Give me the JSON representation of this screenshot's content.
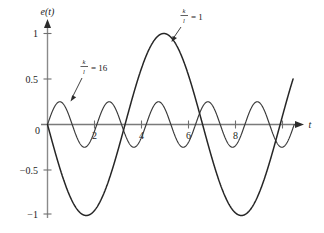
{
  "figure": {
    "name": "oscillation-response-plot",
    "background": "#ffffff",
    "ink_color": "#262626",
    "axis_color": "#7a7a7a"
  },
  "axes": {
    "y_label": "e(t)",
    "x_label": "t",
    "y_ticks": [
      "1",
      "0.5",
      "0",
      "−0.5",
      "−1"
    ],
    "y_tick_values": [
      1,
      0.5,
      0,
      -0.5,
      -1
    ],
    "x_ticks": [
      "2",
      "4",
      "6",
      "8"
    ],
    "x_tick_values": [
      2,
      4,
      6,
      8
    ],
    "origin_label": "0",
    "xlim": [
      0,
      10.6
    ],
    "ylim": [
      -1.12,
      1.12
    ]
  },
  "annotations": [
    {
      "name": "annotation-ratio-16",
      "numerator": "k",
      "denominator": "l",
      "equals": "= 16",
      "text": "k/l = 16",
      "label_x": 84,
      "label_y": 68,
      "arrow_from_x": 81,
      "arrow_from_y": 80,
      "arrow_to_x": 72,
      "arrow_to_y": 100
    },
    {
      "name": "annotation-ratio-1",
      "numerator": "k",
      "denominator": "l",
      "equals": "= 1",
      "text": "k/l = 1",
      "label_x": 182,
      "label_y": 17,
      "arrow_from_x": 180,
      "arrow_from_y": 26,
      "arrow_to_x": 172,
      "arrow_to_y": 40
    }
  ],
  "chart_data": {
    "type": "line",
    "title": "",
    "xlabel": "t",
    "ylabel": "e(t)",
    "xlim": [
      0,
      10.6
    ],
    "ylim": [
      -1.12,
      1.12
    ],
    "grid": false,
    "legend": "inline-annotations",
    "x_ticks": [
      2,
      4,
      6,
      8
    ],
    "y_ticks": [
      -1,
      -0.5,
      0,
      0.5,
      1
    ],
    "series": [
      {
        "name": "k/l = 1",
        "label": "k/l = 1",
        "color": "#262626",
        "linewidth": 1.5,
        "amplitude": 1.0,
        "period": 6.6,
        "phase": "starts at 0 and decreases first (negative sine)",
        "formula": "-sin(2*pi*t/6.6)",
        "x": [
          0,
          0.33,
          0.66,
          0.99,
          1.32,
          1.65,
          1.98,
          2.31,
          2.64,
          2.97,
          3.3,
          3.63,
          3.96,
          4.29,
          4.62,
          4.95,
          5.28,
          5.61,
          5.94,
          6.27,
          6.6,
          6.93,
          7.26,
          7.59,
          7.92,
          8.25,
          8.58,
          8.91,
          9.24,
          9.57,
          9.9,
          10.23,
          10.56
        ],
        "y": [
          0,
          -0.309,
          -0.588,
          -0.809,
          -0.951,
          -1.0,
          -0.951,
          -0.809,
          -0.588,
          -0.309,
          0,
          0.309,
          0.588,
          0.809,
          0.951,
          1.0,
          0.951,
          0.809,
          0.588,
          0.309,
          0,
          -0.309,
          -0.588,
          -0.809,
          -0.951,
          -1.0,
          -0.951,
          -0.809,
          -0.588,
          -0.309,
          0,
          0.309,
          0.588
        ]
      },
      {
        "name": "k/l = 16",
        "label": "k/l = 16",
        "color": "#3a3a3a",
        "linewidth": 1.15,
        "amplitude": 0.25,
        "period": 2.1,
        "phase": "starts at 0 and increases first (positive sine)",
        "formula": "0.25*sin(2*pi*t/2.1)",
        "x": [
          0,
          0.2625,
          0.525,
          0.7875,
          1.05,
          1.3125,
          1.575,
          1.8375,
          2.1,
          2.3625,
          2.625,
          2.8875,
          3.15,
          3.4125,
          3.675,
          3.9375,
          4.2,
          4.4625,
          4.725,
          4.9875,
          5.25,
          5.5125,
          5.775,
          6.0375,
          6.3,
          6.5625,
          6.825,
          7.0875,
          7.35,
          7.6125,
          7.875,
          8.1375,
          8.4,
          8.6625,
          8.925,
          9.1875,
          9.45,
          9.7125,
          9.975,
          10.2375,
          10.5
        ],
        "y": [
          0,
          0.177,
          0.25,
          0.177,
          0,
          -0.177,
          -0.25,
          -0.177,
          0,
          0.177,
          0.25,
          0.177,
          0,
          -0.177,
          -0.25,
          -0.177,
          0,
          0.177,
          0.25,
          0.177,
          0,
          -0.177,
          -0.25,
          -0.177,
          0,
          0.177,
          0.25,
          0.177,
          0,
          -0.177,
          -0.25,
          -0.177,
          0,
          0.177,
          0.25,
          0.177,
          0,
          -0.177,
          -0.25,
          -0.177,
          0
        ]
      }
    ]
  }
}
